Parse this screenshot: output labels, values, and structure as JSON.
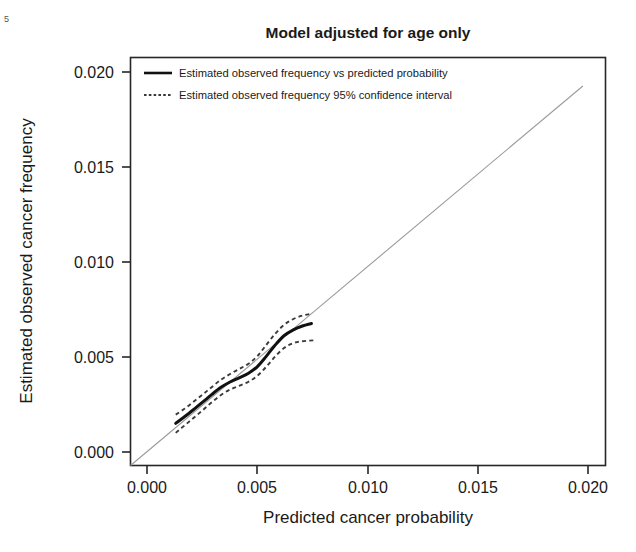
{
  "chart_data": {
    "type": "line",
    "title": "Model adjusted for age only",
    "xlabel": "Predicted cancer probability",
    "ylabel": "Estimated observed cancer frequency",
    "xlim": [
      0.0,
      0.021
    ],
    "ylim": [
      0.0,
      0.0215
    ],
    "grid": false,
    "legend_position": "top-left-inside",
    "xticks": [
      0.0,
      0.005,
      0.01,
      0.015,
      0.02
    ],
    "xticklabels": [
      "0.000",
      "0.005",
      "0.010",
      "0.015",
      "0.020"
    ],
    "yticks": [
      0.0,
      0.005,
      0.01,
      0.015,
      0.02
    ],
    "yticklabels": [
      "0.000",
      "0.005",
      "0.010",
      "0.015",
      "0.020"
    ],
    "legend": [
      {
        "label": "Estimated observed frequency vs predicted probability",
        "style": "solid"
      },
      {
        "label": "Estimated observed frequency 95% confidence interval",
        "style": "dotted"
      }
    ],
    "series": [
      {
        "name": "Reference diagonal (perfect calibration)",
        "style": "thin-solid-grey",
        "x": [
          0.0,
          0.02
        ],
        "y": [
          0.0,
          0.02
        ]
      },
      {
        "name": "Estimated observed frequency vs predicted probability",
        "style": "solid",
        "x": [
          0.002,
          0.0024,
          0.0028,
          0.0032,
          0.0036,
          0.004,
          0.0044,
          0.0048,
          0.0052,
          0.0056,
          0.006,
          0.0064,
          0.0068,
          0.0072,
          0.0076,
          0.008
        ],
        "y": [
          0.00222,
          0.00258,
          0.00296,
          0.00335,
          0.00375,
          0.00412,
          0.0044,
          0.00462,
          0.00485,
          0.0052,
          0.00575,
          0.00635,
          0.00685,
          0.00715,
          0.00735,
          0.00748
        ]
      },
      {
        "name": "Upper 95% confidence limit",
        "style": "dotted",
        "x": [
          0.002,
          0.0024,
          0.0028,
          0.0032,
          0.0036,
          0.004,
          0.0044,
          0.0048,
          0.0052,
          0.0056,
          0.006,
          0.0064,
          0.0068,
          0.0072,
          0.0076,
          0.008
        ],
        "y": [
          0.00268,
          0.003,
          0.00337,
          0.00375,
          0.00414,
          0.00452,
          0.00482,
          0.00508,
          0.00535,
          0.00575,
          0.00635,
          0.00695,
          0.00742,
          0.00772,
          0.0079,
          0.008
        ]
      },
      {
        "name": "Lower 95% confidence limit",
        "style": "dotted",
        "x": [
          0.002,
          0.0024,
          0.0028,
          0.0032,
          0.0036,
          0.004,
          0.0044,
          0.0048,
          0.0052,
          0.0056,
          0.006,
          0.0064,
          0.0068,
          0.0072,
          0.0076,
          0.0082
        ],
        "y": [
          0.00172,
          0.00212,
          0.00252,
          0.00292,
          0.00334,
          0.00372,
          0.004,
          0.0042,
          0.0044,
          0.00472,
          0.0052,
          0.00575,
          0.0062,
          0.00645,
          0.00655,
          0.0066
        ]
      }
    ]
  },
  "figure": {
    "corner_mark": "5"
  }
}
